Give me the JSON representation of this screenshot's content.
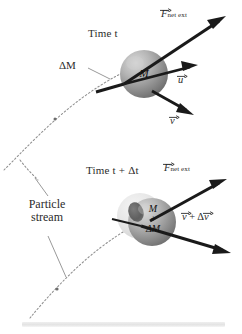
{
  "figure": {
    "background_color": "#ffffff",
    "width": 242,
    "height": 334
  },
  "panels": [
    {
      "id": "upper",
      "time_label": "Time t",
      "mass_label": "M",
      "delta_mass_label": "ΔM",
      "vectors": [
        {
          "name": "F_net_ext",
          "symbol": "F",
          "subscript": "net ext",
          "has_vector_arrow": true,
          "label_text": "F"
        },
        {
          "name": "u",
          "symbol": "u",
          "subscript": "",
          "has_vector_arrow": true,
          "label_text": "u"
        },
        {
          "name": "v",
          "symbol": "v",
          "subscript": "",
          "has_vector_arrow": true,
          "label_text": "v"
        }
      ]
    },
    {
      "id": "lower",
      "time_label": "Time t + Δt",
      "mass_label_line1": "M",
      "mass_label_line2": "+",
      "mass_label_line3": "ΔM",
      "stream_label_line1": "Particle",
      "stream_label_line2": "stream",
      "vectors": [
        {
          "name": "F_net_ext",
          "symbol": "F",
          "subscript": "net ext",
          "has_vector_arrow": true,
          "label_text": "F"
        },
        {
          "name": "v_plus_delta_v",
          "symbol": "v + Δv",
          "subscript": "",
          "has_vector_arrow": true,
          "label_text": "v + Δv"
        }
      ]
    }
  ],
  "text": {
    "time_t": "Time t",
    "time_t_dt": "Time t + Δt",
    "delta_M": "ΔM",
    "particle": "Particle",
    "stream": "stream",
    "F_symbol": "F",
    "F_subscript": "net ext",
    "u_symbol": "u",
    "v_symbol": "v",
    "v_plus": "+",
    "dv_symbol": "v",
    "delta_glyph": "Δ",
    "M_upper": "M",
    "M_lower_1": "M",
    "M_lower_2": "+",
    "M_lower_3": "ΔM"
  },
  "colors": {
    "arrow": "#1a1a1a",
    "curve": "#8a8a8a",
    "sphere_dark": "#7d7d7d",
    "sphere_light": "#d8d8d8",
    "sphere_ghost": "#e6e6e6",
    "text": "#2b2b2b",
    "base_bar": "#e9e9e9"
  },
  "icons": {
    "vector_arrow": "vector-arrow-overbar",
    "trajectory": "dashed-trajectory-curve",
    "leader": "leader-line"
  }
}
